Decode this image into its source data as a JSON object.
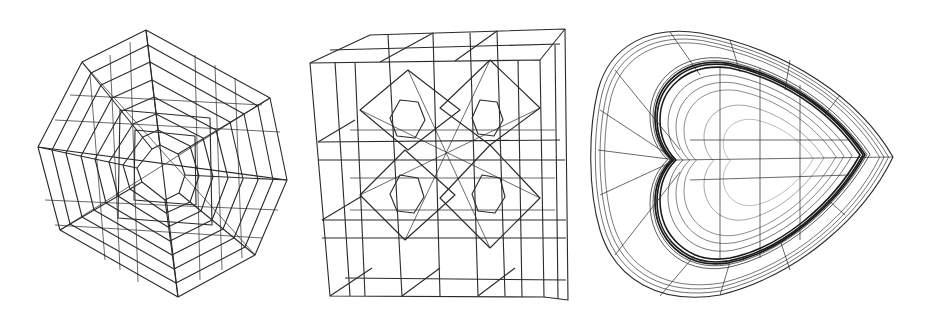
{
  "figure": {
    "background": "#ffffff",
    "line_color": "#2a2a2a",
    "panels": [
      {
        "id": "octagon",
        "description": "Nested octagonal hexahedral wireframe mesh"
      },
      {
        "id": "cube",
        "description": "Cube subdivided into 3x3 grid with inner octahedral refinement wireframe"
      },
      {
        "id": "heart",
        "description": "Heart-shaped swept hexahedral wireframe mesh with dense boundary layers"
      }
    ]
  }
}
